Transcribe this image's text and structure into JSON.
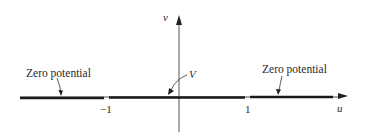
{
  "diagram": {
    "axes": {
      "horizontal_label": "u",
      "vertical_label": "v"
    },
    "ticks": [
      {
        "label": "−1",
        "value": -1
      },
      {
        "label": "1",
        "value": 1
      }
    ],
    "annotations": {
      "left_region": "Zero potential",
      "right_region": "Zero potential",
      "center_segment": "V"
    },
    "colors": {
      "line": "#1a1a1a",
      "axis": "#555555",
      "text": "#2a2a2a"
    }
  }
}
